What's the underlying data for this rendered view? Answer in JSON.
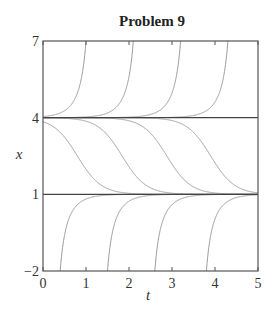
{
  "chart_data": {
    "type": "line",
    "title": "Problem 9",
    "xlabel": "t",
    "ylabel": "x",
    "xlim": [
      0,
      5
    ],
    "ylim": [
      -2,
      7
    ],
    "xticks": [
      0,
      1,
      2,
      3,
      4,
      5
    ],
    "yticks": [
      -2,
      1,
      4,
      7
    ],
    "grid": false,
    "legend": null,
    "equilibria": [
      {
        "name": "x=4",
        "value": 4
      },
      {
        "name": "x=1",
        "value": 1
      }
    ],
    "model": {
      "equation": "dx/dt = r(x-1)(x-4)",
      "r": 1.2
    },
    "series": [
      {
        "name": "upper-1",
        "region": "above 4",
        "crosses_top_at_t": 1.0
      },
      {
        "name": "upper-2",
        "region": "above 4",
        "crosses_top_at_t": 2.1
      },
      {
        "name": "upper-3",
        "region": "above 4",
        "crosses_top_at_t": 3.2
      },
      {
        "name": "upper-4",
        "region": "above 4",
        "crosses_top_at_t": 4.3
      },
      {
        "name": "middle-1",
        "region": "between 1 and 4",
        "midpoint_t": 0.8
      },
      {
        "name": "middle-2",
        "region": "between 1 and 4",
        "midpoint_t": 1.84
      },
      {
        "name": "middle-3",
        "region": "between 1 and 4",
        "midpoint_t": 2.88
      },
      {
        "name": "middle-4",
        "region": "between 1 and 4",
        "midpoint_t": 3.9
      },
      {
        "name": "lower-1",
        "region": "below 1",
        "crosses_bottom_at_t": 0.4
      },
      {
        "name": "lower-2",
        "region": "below 1",
        "crosses_bottom_at_t": 1.5
      },
      {
        "name": "lower-3",
        "region": "below 1",
        "crosses_bottom_at_t": 2.6
      },
      {
        "name": "lower-4",
        "region": "below 1",
        "crosses_bottom_at_t": 3.8
      }
    ]
  },
  "style": {
    "axis_color": "#555555",
    "equilibrium_color": "#444444",
    "curve_color": "#9a9a9a"
  }
}
